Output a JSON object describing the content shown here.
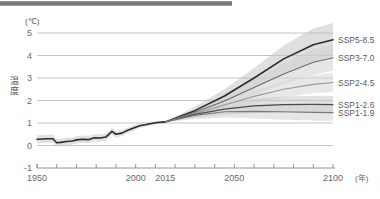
{
  "figure": {
    "top_rule": "decorative-heading-rule"
  },
  "axes": {
    "y_unit": "(℃)",
    "y_axis_title": "温度",
    "y_ticks": [
      "5",
      "4",
      "3",
      "2",
      "1",
      "0",
      "-1"
    ],
    "y_tick_values": [
      5,
      4,
      3,
      2,
      1,
      0,
      -1
    ],
    "x_unit": "(年)",
    "x_ticks": [
      "1950",
      "2000",
      "2015",
      "2050",
      "2100"
    ],
    "x_tick_values": [
      1950,
      2000,
      2015,
      2050,
      2100
    ]
  },
  "legend": {
    "items": [
      {
        "label": "SSP5-8.5",
        "color": "#2b2b2b",
        "y_end": 4.7
      },
      {
        "label": "SSP3-7.0",
        "color": "#6a6a6a",
        "y_end": 3.9
      },
      {
        "label": "SSP2-4.5",
        "color": "#9a9a9a",
        "y_end": 2.8
      },
      {
        "label": "SSP1-2.6",
        "color": "#4a4a4a",
        "y_end": 1.82
      },
      {
        "label": "SSP1-1.9",
        "color": "#7a7a7a",
        "y_end": 1.46
      }
    ]
  },
  "chart_data": {
    "type": "line",
    "title": "",
    "subtitle": "",
    "xlabel": "(年)",
    "ylabel": "温度 (℃)",
    "xlim": [
      1950,
      2100
    ],
    "ylim": [
      -1,
      5
    ],
    "grid": "horizontal",
    "legend_position": "right-inline",
    "annotations": [
      {
        "text": "historical observations end / projections branch",
        "x": 2015,
        "y": 1.05
      }
    ],
    "series": [
      {
        "name": "historical",
        "color": "#2b2b2b",
        "band_color": "#c9c9c9",
        "x": [
          1950,
          1955,
          1958,
          1960,
          1962,
          1965,
          1968,
          1970,
          1973,
          1976,
          1979,
          1982,
          1985,
          1988,
          1990,
          1993,
          1996,
          1999,
          2002,
          2005,
          2008,
          2011,
          2015
        ],
        "values": [
          0.28,
          0.3,
          0.3,
          0.12,
          0.14,
          0.18,
          0.2,
          0.25,
          0.28,
          0.26,
          0.34,
          0.33,
          0.38,
          0.63,
          0.5,
          0.55,
          0.68,
          0.78,
          0.88,
          0.92,
          0.98,
          1.02,
          1.05
        ],
        "band_lower": [
          0.1,
          0.12,
          0.12,
          -0.04,
          -0.02,
          0.02,
          0.04,
          0.09,
          0.12,
          0.1,
          0.18,
          0.17,
          0.22,
          0.47,
          0.36,
          0.41,
          0.55,
          0.66,
          0.78,
          0.83,
          0.9,
          0.95,
          1.0
        ],
        "band_upper": [
          0.46,
          0.48,
          0.48,
          0.28,
          0.3,
          0.34,
          0.36,
          0.41,
          0.44,
          0.42,
          0.5,
          0.49,
          0.54,
          0.79,
          0.64,
          0.69,
          0.81,
          0.9,
          0.98,
          1.01,
          1.06,
          1.09,
          1.1
        ]
      },
      {
        "name": "SSP5-8.5",
        "color": "#2b2b2b",
        "band_color": "#c4c4c4",
        "x": [
          2015,
          2030,
          2045,
          2060,
          2075,
          2090,
          2100
        ],
        "values": [
          1.05,
          1.55,
          2.2,
          3.0,
          3.85,
          4.48,
          4.7
        ],
        "band_lower": [
          1.05,
          1.4,
          1.92,
          2.55,
          3.22,
          3.75,
          3.95
        ],
        "band_upper": [
          1.05,
          1.72,
          2.5,
          3.45,
          4.45,
          5.2,
          5.45
        ]
      },
      {
        "name": "SSP3-7.0",
        "color": "#6a6a6a",
        "band_color": "#cfcfcf",
        "x": [
          2015,
          2030,
          2045,
          2060,
          2075,
          2090,
          2100
        ],
        "values": [
          1.05,
          1.48,
          1.98,
          2.58,
          3.18,
          3.7,
          3.9
        ],
        "band_lower": [
          1.05,
          1.36,
          1.76,
          2.24,
          2.72,
          3.14,
          3.32
        ],
        "band_upper": [
          1.05,
          1.6,
          2.2,
          2.92,
          3.64,
          4.26,
          4.48
        ]
      },
      {
        "name": "SSP2-4.5",
        "color": "#9a9a9a",
        "band_color": "#d6d6d6",
        "x": [
          2015,
          2030,
          2045,
          2060,
          2075,
          2090,
          2100
        ],
        "values": [
          1.05,
          1.42,
          1.8,
          2.18,
          2.5,
          2.72,
          2.8
        ],
        "band_lower": [
          1.05,
          1.3,
          1.6,
          1.9,
          2.14,
          2.32,
          2.38
        ],
        "band_upper": [
          1.05,
          1.54,
          2.0,
          2.46,
          2.86,
          3.12,
          3.22
        ]
      },
      {
        "name": "SSP1-2.6",
        "color": "#4a4a4a",
        "band_color": "#c9c9c9",
        "x": [
          2015,
          2030,
          2045,
          2060,
          2075,
          2090,
          2100
        ],
        "values": [
          1.05,
          1.38,
          1.62,
          1.76,
          1.82,
          1.83,
          1.82
        ],
        "band_lower": [
          1.05,
          1.22,
          1.36,
          1.44,
          1.46,
          1.45,
          1.44
        ],
        "band_upper": [
          1.05,
          1.54,
          1.88,
          2.08,
          2.18,
          2.21,
          2.2
        ]
      },
      {
        "name": "SSP1-1.9",
        "color": "#7a7a7a",
        "band_color": "#d2d2d2",
        "x": [
          2015,
          2030,
          2045,
          2060,
          2075,
          2090,
          2100
        ],
        "values": [
          1.05,
          1.34,
          1.5,
          1.52,
          1.5,
          1.47,
          1.46
        ],
        "band_lower": [
          1.05,
          1.18,
          1.24,
          1.2,
          1.15,
          1.11,
          1.1
        ],
        "band_upper": [
          1.05,
          1.5,
          1.76,
          1.84,
          1.85,
          1.83,
          1.82
        ]
      }
    ]
  }
}
